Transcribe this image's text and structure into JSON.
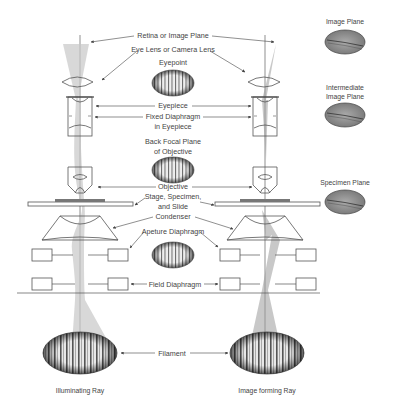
{
  "diagram": {
    "center_labels": {
      "retina": "Retina or Image Plane",
      "eye_lens": "Eye Lens or Camera Lens",
      "eyepoint": "Eyepoint",
      "eyepiece": "Eyepiece",
      "fixed_diaphragm_1": "Fixed Diaphragm",
      "fixed_diaphragm_2": "in Eyepiece",
      "back_focal_1": "Back Focal Plane",
      "back_focal_2": "of Objective",
      "objective": "Objective",
      "stage_1": "Stage, Specimen,",
      "stage_2": "and Slide",
      "condenser": "Condenser",
      "aperture_diaphragm": "Apeture Diaphragm",
      "field_diaphragm": "Field Diaphragm",
      "filament": "Filament"
    },
    "right_labels": {
      "image_plane": "Image Plane",
      "intermediate_1": "Intermediate",
      "intermediate_2": "Image Plane",
      "specimen_plane": "Specimen Plane"
    },
    "bottom_labels": {
      "left": "Illuminating Ray",
      "right": "Image forming Ray"
    },
    "colors": {
      "beam": "#9a9a9a",
      "line": "#555555",
      "text": "#444444"
    }
  }
}
